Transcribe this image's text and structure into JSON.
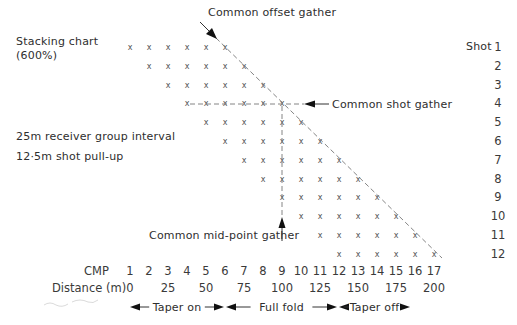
{
  "figure": {
    "title": "Stacking chart",
    "subtitle": "(600%)",
    "notes": [
      "25m receiver group interval",
      "12·5m shot pull-up"
    ],
    "shot_header": "Shot",
    "shots": [
      "1",
      "2",
      "3",
      "4",
      "5",
      "6",
      "7",
      "8",
      "9",
      "10",
      "11",
      "12"
    ],
    "fold": 6,
    "cmp_label": "CMP",
    "cmps": [
      "1",
      "2",
      "3",
      "4",
      "5",
      "6",
      "7",
      "8",
      "9",
      "10",
      "11",
      "12",
      "13",
      "14",
      "15",
      "16",
      "17"
    ],
    "distance_label": "Distance (m)",
    "distances": [
      {
        "cmp": 1,
        "value": "0"
      },
      {
        "cmp": 3,
        "value": "25"
      },
      {
        "cmp": 5,
        "value": "50"
      },
      {
        "cmp": 7,
        "value": "75"
      },
      {
        "cmp": 9,
        "value": "100"
      },
      {
        "cmp": 11,
        "value": "125"
      },
      {
        "cmp": 13,
        "value": "150"
      },
      {
        "cmp": 15,
        "value": "175"
      },
      {
        "cmp": 17,
        "value": "200"
      }
    ],
    "marker": "x",
    "annotations": {
      "common_offset": "Common offset gather",
      "common_shot": "Common shot gather",
      "common_midpoint": "Common mid-point gather"
    },
    "ranges": [
      {
        "label": "Taper on",
        "from_x": 130,
        "to_x": 224
      },
      {
        "label": "Full fold",
        "from_x": 226,
        "to_x": 337
      },
      {
        "label": "Taper off",
        "from_x": 339,
        "to_x": 410
      }
    ],
    "colors": {
      "ink": "#2e2e2e",
      "dash": "#777777",
      "background": "#ffffff"
    }
  }
}
